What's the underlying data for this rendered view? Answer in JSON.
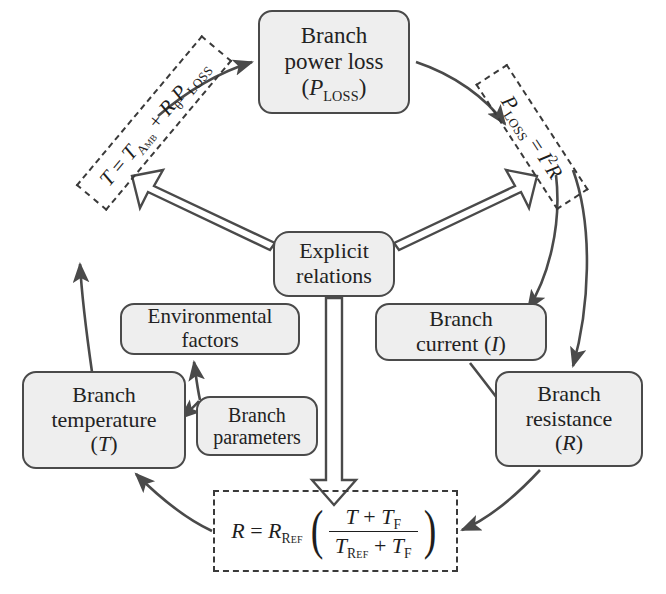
{
  "diagram": {
    "colors": {
      "node_fill": "#eeeeee",
      "node_stroke": "#4a4a4a",
      "arrow_stroke": "#4a4a4a",
      "dashed_stroke": "#3a3a3a",
      "text": "#222222",
      "background": "#ffffff"
    }
  },
  "nodes": [
    {
      "id": "power-loss",
      "name": "branch-power-loss",
      "lines": [
        "Branch",
        "power loss",
        "(P_LOSS)"
      ],
      "line1": "Branch",
      "line2": "power loss",
      "symbol_base": "P",
      "symbol_sub": "LOSS"
    },
    {
      "id": "explicit",
      "name": "explicit-relations",
      "line1": "Explicit",
      "line2": "relations"
    },
    {
      "id": "environmental",
      "name": "environmental-factors",
      "line1": "Environmental",
      "line2": "factors"
    },
    {
      "id": "current",
      "name": "branch-current",
      "line1": "Branch",
      "line2": "current",
      "symbol": "I"
    },
    {
      "id": "temperature",
      "name": "branch-temperature",
      "line1": "Branch",
      "line2": "temperature",
      "symbol": "T"
    },
    {
      "id": "parameters",
      "name": "branch-parameters",
      "line1": "Branch",
      "line2": "parameters"
    },
    {
      "id": "resistance",
      "name": "branch-resistance",
      "line1": "Branch",
      "line2": "resistance",
      "symbol": "R"
    }
  ],
  "formulas": {
    "temperature": {
      "name": "temperature-relation",
      "plain": "T = T_Amb + R_theta P_LOSS",
      "lhs": "T",
      "eq": "=",
      "t_amb_base": "T",
      "t_amb_sub": "Amb",
      "plus": "+",
      "r_theta_base": "R",
      "r_theta_sub": "θ",
      "p_loss_base": "P",
      "p_loss_sub": "LOSS",
      "rotation_deg": -50
    },
    "power_loss": {
      "name": "power-loss-relation",
      "plain": "P_LOSS = I^2 R",
      "lhs_base": "P",
      "lhs_sub": "LOSS",
      "eq": "=",
      "current": "I",
      "exponent": "2",
      "resistance": "R",
      "rotation_deg": 57
    },
    "resistance": {
      "name": "resistance-relation",
      "plain": "R = R_Ref ( (T + T_F) / (T_Ref + T_F) )",
      "lhs": "R",
      "eq": "=",
      "r_ref_base": "R",
      "r_ref_sub": "Ref",
      "numerator_a": "T",
      "numerator_plus": "+",
      "numerator_b_base": "T",
      "numerator_b_sub": "F",
      "denominator_a_base": "T",
      "denominator_a_sub": "Ref",
      "denominator_plus": "+",
      "denominator_b_base": "T",
      "denominator_b_sub": "F",
      "paren_open": "(",
      "paren_close": ")"
    }
  },
  "edges": [
    {
      "name": "edge-temp-formula-to-power-loss",
      "from": "temperature-relation",
      "to": "branch-power-loss",
      "style": "curved-thin"
    },
    {
      "name": "edge-power-loss-to-ploss-formula",
      "from": "branch-power-loss",
      "to": "power-loss-relation",
      "style": "curved-thin"
    },
    {
      "name": "edge-ploss-formula-to-current",
      "from": "power-loss-relation",
      "to": "branch-current",
      "style": "curved-thin"
    },
    {
      "name": "edge-ploss-formula-to-resistance",
      "from": "power-loss-relation",
      "to": "branch-resistance",
      "style": "curved-thin"
    },
    {
      "name": "edge-current-to-resistance",
      "from": "branch-current",
      "to": "branch-resistance",
      "style": "curved-thin"
    },
    {
      "name": "edge-resistance-to-resistance-formula",
      "from": "branch-resistance",
      "to": "resistance-relation",
      "style": "curved-thin"
    },
    {
      "name": "edge-resistance-formula-to-temperature",
      "from": "resistance-relation",
      "to": "branch-temperature",
      "style": "curved-thin"
    },
    {
      "name": "edge-temperature-to-temp-formula",
      "from": "branch-temperature",
      "to": "temperature-relation",
      "style": "curved-thin"
    },
    {
      "name": "edge-parameters-to-environmental",
      "from": "branch-parameters",
      "to": "environmental-factors",
      "style": "curved-thin"
    },
    {
      "name": "edge-parameters-to-temperature",
      "from": "branch-parameters",
      "to": "branch-temperature",
      "style": "curved-thin"
    },
    {
      "name": "edge-explicit-to-temp-formula",
      "from": "explicit-relations",
      "to": "temperature-relation",
      "style": "block-arrow"
    },
    {
      "name": "edge-explicit-to-ploss-formula",
      "from": "explicit-relations",
      "to": "power-loss-relation",
      "style": "block-arrow"
    },
    {
      "name": "edge-explicit-to-resistance-formula",
      "from": "explicit-relations",
      "to": "resistance-relation",
      "style": "block-arrow"
    }
  ]
}
